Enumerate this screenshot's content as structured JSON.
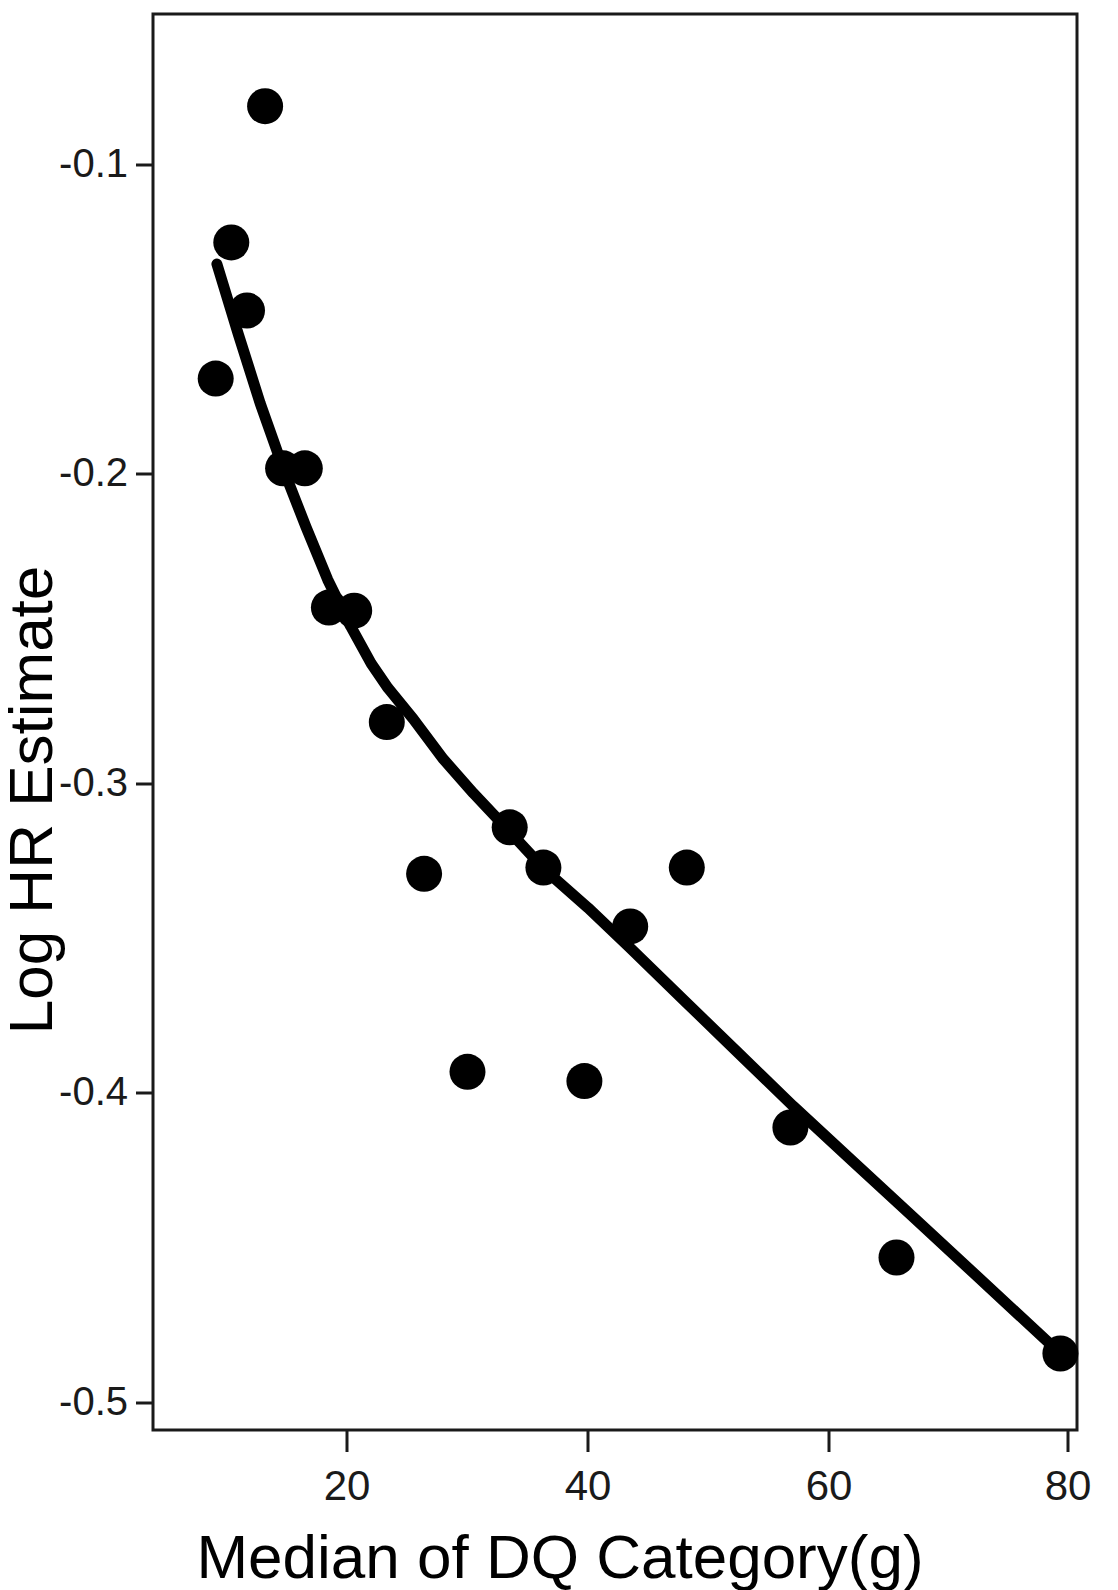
{
  "chart_data": {
    "type": "scatter",
    "title": "",
    "xlabel": "Median of DQ Category(g)",
    "ylabel": "Log HR Estimate",
    "xlim": [
      6.5,
      83.0
    ],
    "ylim": [
      -0.527,
      -0.0525
    ],
    "xticks": [
      20,
      40,
      60,
      80
    ],
    "xtick_labels": [
      "20",
      "40",
      "60",
      "80"
    ],
    "yticks": [
      -0.1,
      -0.2,
      -0.3,
      -0.4,
      -0.5
    ],
    "ytick_labels": [
      "-0.1",
      "-0.2",
      "-0.3",
      "-0.4",
      "-0.5"
    ],
    "grid": false,
    "legend": false,
    "marker_color": "#000000",
    "marker_shape": "circle",
    "line_color": "#000000",
    "series": [
      {
        "name": "Observed log HR by DQ category",
        "type": "scatter",
        "points": [
          {
            "x": 13.2,
            "y": -0.081
          },
          {
            "x": 10.4,
            "y": -0.125
          },
          {
            "x": 11.7,
            "y": -0.147
          },
          {
            "x": 9.1,
            "y": -0.169
          },
          {
            "x": 14.7,
            "y": -0.198
          },
          {
            "x": 16.5,
            "y": -0.198
          },
          {
            "x": 18.5,
            "y": -0.243
          },
          {
            "x": 20.6,
            "y": -0.244
          },
          {
            "x": 23.3,
            "y": -0.28
          },
          {
            "x": 26.4,
            "y": -0.329
          },
          {
            "x": 30.0,
            "y": -0.393
          },
          {
            "x": 33.5,
            "y": -0.314
          },
          {
            "x": 36.3,
            "y": -0.327
          },
          {
            "x": 39.7,
            "y": -0.396
          },
          {
            "x": 43.5,
            "y": -0.346
          },
          {
            "x": 48.2,
            "y": -0.327
          },
          {
            "x": 56.8,
            "y": -0.411
          },
          {
            "x": 65.6,
            "y": -0.453
          },
          {
            "x": 79.2,
            "y": -0.484
          }
        ]
      },
      {
        "name": "Fitted dose-response curve",
        "type": "line",
        "points": [
          {
            "x": 9.2,
            "y": -0.132
          },
          {
            "x": 11.0,
            "y": -0.155
          },
          {
            "x": 12.8,
            "y": -0.177
          },
          {
            "x": 14.8,
            "y": -0.199
          },
          {
            "x": 16.6,
            "y": -0.217
          },
          {
            "x": 18.4,
            "y": -0.234
          },
          {
            "x": 20.3,
            "y": -0.249
          },
          {
            "x": 22.0,
            "y": -0.261
          },
          {
            "x": 23.4,
            "y": -0.269
          },
          {
            "x": 25.5,
            "y": -0.279
          },
          {
            "x": 28.0,
            "y": -0.292
          },
          {
            "x": 30.5,
            "y": -0.303
          },
          {
            "x": 33.4,
            "y": -0.315
          },
          {
            "x": 36.5,
            "y": -0.328
          },
          {
            "x": 40.0,
            "y": -0.34
          },
          {
            "x": 43.5,
            "y": -0.353
          },
          {
            "x": 48.0,
            "y": -0.37
          },
          {
            "x": 52.5,
            "y": -0.387
          },
          {
            "x": 57.0,
            "y": -0.404
          },
          {
            "x": 62.0,
            "y": -0.422
          },
          {
            "x": 67.0,
            "y": -0.44
          },
          {
            "x": 72.0,
            "y": -0.458
          },
          {
            "x": 79.2,
            "y": -0.484
          }
        ]
      }
    ]
  },
  "axes": {
    "x_title": "Median of DQ Category(g)",
    "y_title": "Log HR Estimate",
    "x_tick_labels": [
      "20",
      "40",
      "60",
      "80"
    ],
    "y_tick_labels": [
      "-0.1",
      "-0.2",
      "-0.3",
      "-0.4",
      "-0.5"
    ]
  }
}
